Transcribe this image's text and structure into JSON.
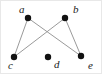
{
  "figure": {
    "type": "undirected-graph-diagram",
    "width": 102,
    "height": 74,
    "background_color": "#ffffff",
    "border_color": "#e8e8e8"
  },
  "style": {
    "vertex_color": "#111111",
    "vertex_radius": 3.2,
    "edge_color": "#9a9a9a",
    "edge_width": 1,
    "label_color": "#1a1a1a",
    "label_font_size": 11
  },
  "vertices": [
    {
      "id": "a",
      "label": "a",
      "x": 27,
      "y": 17,
      "label_x": 18,
      "label_y": 3
    },
    {
      "id": "b",
      "label": "b",
      "x": 64,
      "y": 17,
      "label_x": 72,
      "label_y": 3
    },
    {
      "id": "c",
      "label": "c",
      "x": 13,
      "y": 56,
      "label_x": 7,
      "label_y": 59
    },
    {
      "id": "d",
      "label": "d",
      "x": 47,
      "y": 56,
      "label_x": 53,
      "label_y": 58
    },
    {
      "id": "e",
      "label": "e",
      "x": 80,
      "y": 55,
      "label_x": 87,
      "label_y": 59
    }
  ],
  "edges": [
    {
      "from": "a",
      "to": "c"
    },
    {
      "from": "a",
      "to": "e"
    },
    {
      "from": "b",
      "to": "c"
    },
    {
      "from": "b",
      "to": "e"
    }
  ],
  "isolated_vertices": [
    "d"
  ]
}
